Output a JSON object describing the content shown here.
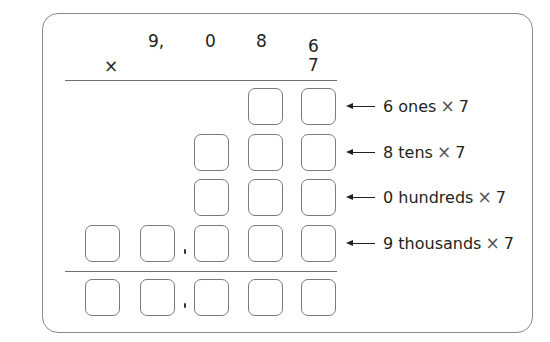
{
  "problem": {
    "multiplicand_digits": [
      "9,",
      "0",
      "8",
      "6"
    ],
    "multiplier": "7",
    "operator": "×"
  },
  "partial_product_rows": [
    {
      "label_digit": "6",
      "label_place": "ones",
      "label_times": "×",
      "label_factor": "7",
      "box_count": 2,
      "has_comma": false
    },
    {
      "label_digit": "8",
      "label_place": "tens",
      "label_times": "×",
      "label_factor": "7",
      "box_count": 3,
      "has_comma": false
    },
    {
      "label_digit": "0",
      "label_place": "hundreds",
      "label_times": "×",
      "label_factor": "7",
      "box_count": 3,
      "has_comma": false
    },
    {
      "label_digit": "9",
      "label_place": "thousands",
      "label_times": "×",
      "label_factor": "7",
      "box_count": 5,
      "has_comma": true
    }
  ],
  "sum_row": {
    "box_count": 5,
    "has_comma": true
  },
  "labels": [
    "6 ones",
    "8 tens",
    "0 hundreds",
    "9 thousands"
  ]
}
